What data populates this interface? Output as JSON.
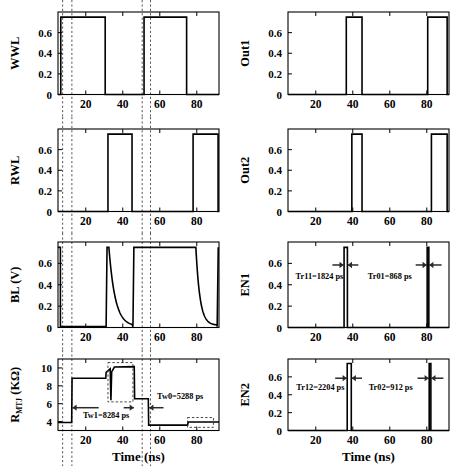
{
  "figure": {
    "type": "multi-panel-waveform-figure",
    "rows": 4,
    "columns": 2,
    "xlabel": "Time (ns)",
    "xlim": [
      5,
      92
    ],
    "xticks": [
      20,
      40,
      60,
      80
    ]
  },
  "chart_data": [
    {
      "id": "wwl",
      "type": "line",
      "title": "",
      "ylabel": "WWL",
      "xlabel": "",
      "xlim": [
        5,
        92
      ],
      "ylim": [
        0,
        0.8
      ],
      "yticks": [
        0,
        0.2,
        0.4,
        0.6
      ],
      "ytick_labels": [
        "0",
        "0.2",
        "0.4",
        "0.6"
      ],
      "xticks": [
        20,
        40,
        60,
        80
      ],
      "grid": false,
      "high_level": 0.75,
      "pulses": [
        [
          6.5,
          30.5
        ],
        [
          51.5,
          74.5
        ]
      ],
      "guides": [
        7.5,
        12.5,
        50.5,
        55.0
      ]
    },
    {
      "id": "rwl",
      "type": "line",
      "ylabel": "RWL",
      "xlabel": "",
      "xlim": [
        5,
        92
      ],
      "ylim": [
        0,
        0.8
      ],
      "yticks": [
        0,
        0.2,
        0.4,
        0.6
      ],
      "ytick_labels": [
        "0",
        "0.2",
        "0.4",
        "0.6"
      ],
      "xticks": [
        20,
        40,
        60,
        80
      ],
      "grid": false,
      "high_level": 0.75,
      "pulses": [
        [
          32.0,
          45.0
        ],
        [
          78.0,
          91.5
        ]
      ],
      "guides": [
        7.5,
        12.5,
        50.5,
        55.0
      ]
    },
    {
      "id": "bl",
      "type": "line",
      "ylabel": "BL (V)",
      "xlabel": "",
      "xlim": [
        5,
        92
      ],
      "ylim": [
        0,
        0.8
      ],
      "yticks": [
        0,
        0.2,
        0.4,
        0.6
      ],
      "ytick_labels": [
        "0",
        "0.2",
        "0.4",
        "0.6"
      ],
      "xticks": [
        20,
        40,
        60,
        80
      ],
      "grid": false,
      "high_level": 0.75,
      "segments": [
        {
          "kind": "high",
          "from": 5.0,
          "to": 6.3
        },
        {
          "kind": "low",
          "from": 6.3,
          "to": 31.0
        },
        {
          "kind": "rise",
          "from": 31.0,
          "to": 31.5
        },
        {
          "kind": "decay",
          "from": 32.5,
          "to": 45.0,
          "start": 0.75,
          "end": 0.01,
          "tau": 3.4
        },
        {
          "kind": "rise",
          "from": 45.5,
          "to": 46.0
        },
        {
          "kind": "high",
          "from": 46.0,
          "to": 79.5
        },
        {
          "kind": "decay",
          "from": 79.5,
          "to": 91.0,
          "start": 0.75,
          "end": 0.02,
          "tau": 2.2
        },
        {
          "kind": "rise",
          "from": 91.0,
          "to": 91.6
        }
      ],
      "guides": [
        7.5,
        12.5,
        50.5,
        55.0
      ]
    },
    {
      "id": "rmtj",
      "type": "line",
      "ylabel": "R_MTJ (KΩ)",
      "ylabel_main": "R",
      "ylabel_sub": "MTJ",
      "ylabel_unit": " (KΩ)",
      "xlabel": "Time (ns)",
      "xlim": [
        5,
        92
      ],
      "ylim": [
        3.0,
        11.0
      ],
      "yticks": [
        4,
        6,
        8,
        10
      ],
      "ytick_labels": [
        "4",
        "6",
        "8",
        "10"
      ],
      "xticks": [
        20,
        40,
        60,
        80
      ],
      "grid": false,
      "points": [
        [
          5.0,
          3.9
        ],
        [
          12.4,
          3.9
        ],
        [
          12.6,
          8.85
        ],
        [
          30.8,
          8.85
        ],
        [
          31.0,
          9.5
        ],
        [
          33.2,
          9.9
        ],
        [
          33.6,
          6.4
        ],
        [
          34.0,
          9.55
        ],
        [
          35.5,
          10.1
        ],
        [
          46.0,
          10.15
        ],
        [
          46.2,
          10.15
        ],
        [
          46.4,
          6.55
        ],
        [
          53.8,
          6.55
        ],
        [
          54.0,
          3.6
        ],
        [
          75.0,
          3.6
        ],
        [
          75.4,
          3.95
        ],
        [
          92.0,
          3.95
        ]
      ],
      "annotations": [
        {
          "text": "Tw1=8284 ps",
          "x": 31.0,
          "y": 4.35
        },
        {
          "text": "Tw0=5288 ps",
          "x": 71.0,
          "y": 6.5
        }
      ],
      "measure_arrows": [
        {
          "from": 27.0,
          "to": 12.8,
          "y": 5.55
        },
        {
          "from": 40.5,
          "to": 46.0,
          "y": 5.55
        },
        {
          "from": 62.0,
          "to": 54.3,
          "y": 5.55
        }
      ],
      "insets": [
        {
          "x0": 32.0,
          "x1": 45.5,
          "y0": 6.2,
          "y1": 10.6
        },
        {
          "x0": 75.0,
          "x1": 89.0,
          "y0": 3.35,
          "y1": 4.45
        }
      ],
      "guides": [
        7.5,
        12.5,
        50.5,
        55.0
      ]
    },
    {
      "id": "out1",
      "type": "line",
      "ylabel": "Out1",
      "xlabel": "",
      "xlim": [
        5,
        92
      ],
      "ylim": [
        0,
        0.8
      ],
      "yticks": [
        0,
        0.2,
        0.4,
        0.6
      ],
      "ytick_labels": [
        "0",
        "0.2",
        "0.4",
        "0.6"
      ],
      "xticks": [
        20,
        40,
        60,
        80
      ],
      "grid": false,
      "high_level": 0.75,
      "pulses": [
        [
          36.5,
          45.0
        ],
        [
          80.5,
          91.0
        ]
      ],
      "guides": []
    },
    {
      "id": "out2",
      "type": "line",
      "ylabel": "Out2",
      "xlabel": "",
      "xlim": [
        5,
        92
      ],
      "ylim": [
        0,
        0.8
      ],
      "yticks": [
        0,
        0.2,
        0.4,
        0.6
      ],
      "ytick_labels": [
        "0",
        "0.2",
        "0.4",
        "0.6"
      ],
      "xticks": [
        20,
        40,
        60,
        80
      ],
      "grid": false,
      "high_level": 0.75,
      "pulses": [
        [
          39.5,
          45.0
        ],
        [
          82.5,
          91.0
        ]
      ],
      "guides": []
    },
    {
      "id": "en1",
      "type": "line",
      "ylabel": "EN1",
      "xlabel": "",
      "xlim": [
        5,
        92
      ],
      "ylim": [
        0,
        0.8
      ],
      "yticks": [
        0,
        0.2,
        0.4,
        0.6
      ],
      "ytick_labels": [
        "0",
        "0.2",
        "0.4",
        "0.6"
      ],
      "xticks": [
        20,
        40,
        60,
        80
      ],
      "grid": false,
      "high_level": 0.75,
      "pulses": [
        [
          35.3,
          37.1
        ],
        [
          80.2,
          81.1
        ]
      ],
      "annotations": [
        {
          "text": "Tr11=1824 ps",
          "x": 22.0,
          "y": 0.45
        },
        {
          "text": "Tr01=868 ps",
          "x": 60.0,
          "y": 0.45
        }
      ],
      "measure_arrows": [
        {
          "from": 29.0,
          "to": 35.1,
          "y": 0.585
        },
        {
          "from": 43.0,
          "to": 37.3,
          "y": 0.585
        },
        {
          "from": 74.0,
          "to": 80.0,
          "y": 0.585
        },
        {
          "from": 88.0,
          "to": 81.3,
          "y": 0.585
        }
      ],
      "guides": []
    },
    {
      "id": "en2",
      "type": "line",
      "ylabel": "EN2",
      "xlabel": "Time (ns)",
      "xlim": [
        5,
        92
      ],
      "ylim": [
        0,
        0.8
      ],
      "yticks": [
        0,
        0.2,
        0.4,
        0.6
      ],
      "ytick_labels": [
        "0",
        "0.2",
        "0.4",
        "0.6"
      ],
      "xticks": [
        20,
        40,
        60,
        80
      ],
      "grid": false,
      "high_level": 0.75,
      "pulses": [
        [
          37.0,
          39.2
        ],
        [
          81.3,
          82.2
        ]
      ],
      "annotations": [
        {
          "text": "Tr12=2204 ps",
          "x": 22.5,
          "y": 0.45
        },
        {
          "text": "Tr02=912 ps",
          "x": 60.5,
          "y": 0.45
        }
      ],
      "measure_arrows": [
        {
          "from": 30.5,
          "to": 36.8,
          "y": 0.585
        },
        {
          "from": 45.0,
          "to": 39.4,
          "y": 0.585
        },
        {
          "from": 75.0,
          "to": 81.1,
          "y": 0.585
        },
        {
          "from": 89.0,
          "to": 82.4,
          "y": 0.585
        }
      ],
      "guides": []
    }
  ],
  "colors": {
    "axis": "#000000",
    "wave": "#000000",
    "guide": "#444444",
    "arrow": "#2b2b2b",
    "background": "#ffffff"
  }
}
